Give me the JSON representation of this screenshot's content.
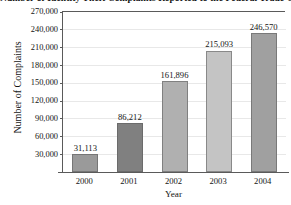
{
  "chart_data": {
    "type": "bar",
    "title": "Number of Identity Theft Complaints Reported to the Federal Trade Commission",
    "xlabel": "Year",
    "ylabel": "Number of Complaints",
    "categories": [
      "2000",
      "2001",
      "2002",
      "2003",
      "2004"
    ],
    "values": [
      31113,
      86212,
      161896,
      215093,
      246570
    ],
    "value_labels": [
      "31,113",
      "86,212",
      "161,896",
      "215,093",
      "246,570"
    ],
    "ylim": [
      0,
      285000
    ],
    "yticks": [
      30000,
      60000,
      90000,
      120000,
      150000,
      180000,
      210000,
      240000,
      270000
    ],
    "ytick_labels": [
      "270,000",
      "240,000",
      "210,000",
      "180,000",
      "150,000",
      "120,000",
      "90,000",
      "60,000",
      "30,000"
    ],
    "grid": true,
    "legend": false,
    "bar_colors": [
      "#9a9a9a",
      "#808080",
      "#b0b0b0",
      "#c4c4c4",
      "#a0a0a0"
    ]
  }
}
